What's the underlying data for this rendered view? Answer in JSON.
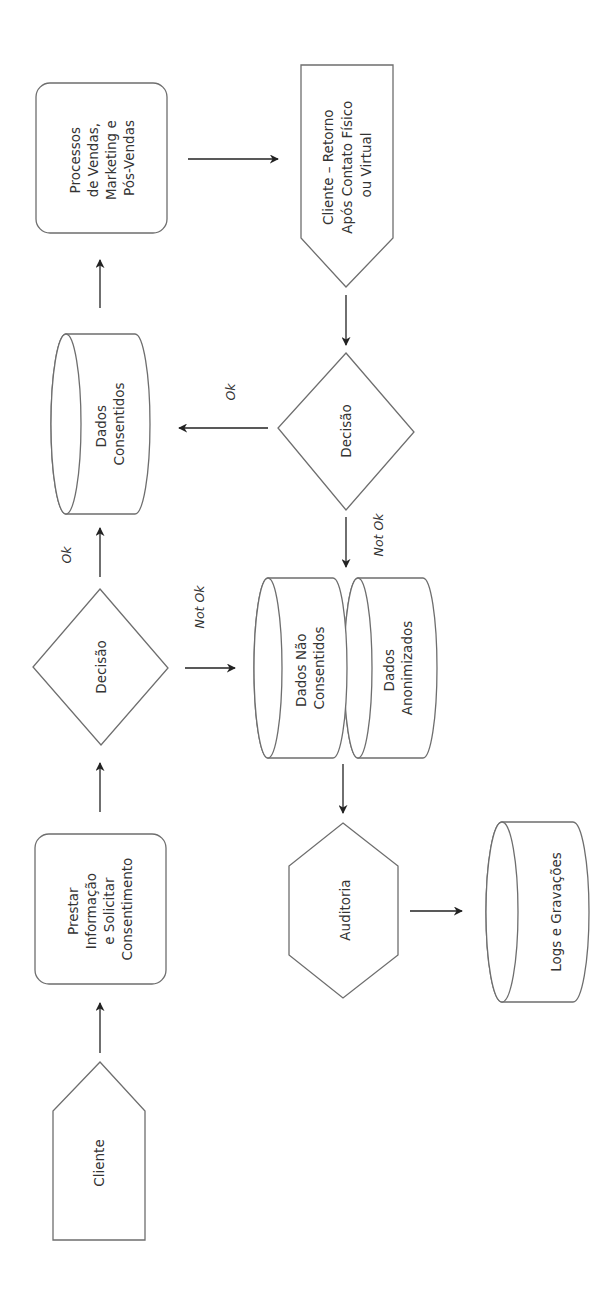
{
  "diagram": {
    "type": "flowchart",
    "orientation": "rotated -90deg (text reads bottom-to-top)",
    "colors": {
      "background": "#ffffff",
      "shape_stroke": "#6e6e6e",
      "arrow": "#222222",
      "text": "#333333"
    },
    "nodes": {
      "cliente": {
        "shape": "pentagon-up",
        "lines": [
          "Cliente"
        ]
      },
      "prestar": {
        "shape": "rounded-rectangle",
        "lines": [
          "Prestar",
          "Informação",
          "e Solicitar",
          "Consentimento"
        ]
      },
      "decisao1": {
        "shape": "diamond",
        "lines": [
          "Decisão"
        ]
      },
      "dados_consentidos": {
        "shape": "cylinder",
        "lines": [
          "Dados",
          "Consentidos"
        ]
      },
      "processos": {
        "shape": "rounded-rectangle",
        "lines": [
          "Processos",
          "de Vendas,",
          "Marketing e",
          "Pós-Vendas"
        ]
      },
      "cliente_retorno": {
        "shape": "pentagon-down",
        "lines": [
          "Cliente – Retorno",
          "Após Contato Físico",
          "ou Virtual"
        ]
      },
      "decisao2": {
        "shape": "diamond",
        "lines": [
          "Decisão"
        ]
      },
      "dados_nao_consentidos": {
        "shape": "cylinder",
        "lines": [
          "Dados Não",
          "Consentidos"
        ]
      },
      "dados_anonimizados": {
        "shape": "cylinder",
        "lines": [
          "Dados",
          "Anonimizados"
        ]
      },
      "auditoria": {
        "shape": "hexagon",
        "lines": [
          "Auditoria"
        ]
      },
      "logs": {
        "shape": "cylinder",
        "lines": [
          "Logs e Gravações"
        ]
      }
    },
    "edges": [
      {
        "from": "cliente",
        "to": "prestar",
        "label": ""
      },
      {
        "from": "prestar",
        "to": "decisao1",
        "label": ""
      },
      {
        "from": "decisao1",
        "to": "dados_consentidos",
        "label": "Ok"
      },
      {
        "from": "decisao1",
        "to": "dados_nao_consentidos",
        "label": "Not Ok"
      },
      {
        "from": "dados_consentidos",
        "to": "processos",
        "label": ""
      },
      {
        "from": "processos",
        "to": "cliente_retorno",
        "label": ""
      },
      {
        "from": "cliente_retorno",
        "to": "decisao2",
        "label": ""
      },
      {
        "from": "decisao2",
        "to": "dados_consentidos",
        "label": "Ok"
      },
      {
        "from": "decisao2",
        "to": "dados_nao_consentidos",
        "label": "Not Ok"
      },
      {
        "from": "dados_nao_consentidos",
        "to": "auditoria",
        "label": ""
      },
      {
        "from": "auditoria",
        "to": "logs",
        "label": ""
      }
    ],
    "edge_labels": {
      "ok_1": "Ok",
      "not_ok_1": "Not Ok",
      "ok_2": "Ok",
      "not_ok_2": "Not Ok"
    }
  }
}
